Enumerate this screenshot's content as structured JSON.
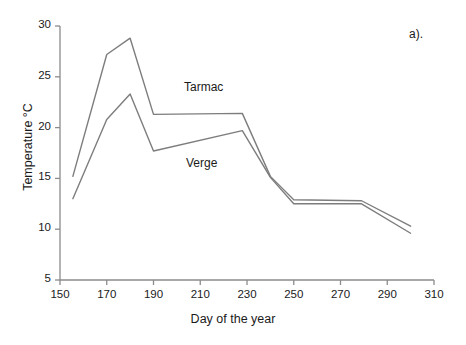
{
  "figure": {
    "panel_tag": "a).",
    "cropped_header_text": "",
    "axis_title_x": "Day of the year",
    "axis_title_y": "Temperature °C"
  },
  "axes": {
    "x_ticks": [
      150,
      170,
      190,
      210,
      230,
      250,
      270,
      290,
      310
    ],
    "y_ticks": [
      5,
      10,
      15,
      20,
      25,
      30
    ],
    "x_min": 150,
    "x_max": 310,
    "y_min": 5,
    "y_max": 30,
    "line_color": "#8c8c8c",
    "text_color": "#1a1a1a"
  },
  "chart_data": {
    "type": "line",
    "title": "",
    "xlabel": "Day of the year",
    "ylabel": "Temperature °C",
    "xlim": [
      150,
      310
    ],
    "ylim": [
      5,
      30
    ],
    "grid": false,
    "legend": "inline-annotations",
    "x_ticks": [
      150,
      170,
      190,
      210,
      230,
      250,
      270,
      290,
      310
    ],
    "y_ticks": [
      5,
      10,
      15,
      20,
      25,
      30
    ],
    "series": [
      {
        "name": "Tarmac",
        "color": "#7d7d7d",
        "label_position": {
          "x": 219,
          "y": 22.8
        },
        "points": [
          {
            "x": 155.5,
            "y": 15.2
          },
          {
            "x": 170.0,
            "y": 27.2
          },
          {
            "x": 180.0,
            "y": 28.8
          },
          {
            "x": 190.0,
            "y": 21.3
          },
          {
            "x": 228.0,
            "y": 21.4
          },
          {
            "x": 240.0,
            "y": 15.2
          },
          {
            "x": 250.0,
            "y": 12.9
          },
          {
            "x": 279.0,
            "y": 12.8
          },
          {
            "x": 300.0,
            "y": 10.3
          }
        ]
      },
      {
        "name": "Verge",
        "color": "#7d7d7d",
        "label_position": {
          "x": 223,
          "y": 15.4
        },
        "points": [
          {
            "x": 155.5,
            "y": 13.0
          },
          {
            "x": 170.0,
            "y": 20.8
          },
          {
            "x": 180.0,
            "y": 23.3
          },
          {
            "x": 190.0,
            "y": 17.7
          },
          {
            "x": 228.0,
            "y": 19.7
          },
          {
            "x": 240.0,
            "y": 15.1
          },
          {
            "x": 250.0,
            "y": 12.5
          },
          {
            "x": 279.0,
            "y": 12.5
          },
          {
            "x": 300.0,
            "y": 9.6
          }
        ]
      }
    ]
  }
}
